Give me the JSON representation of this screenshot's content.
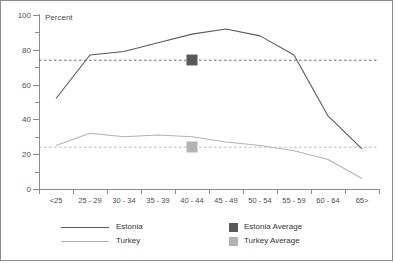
{
  "chart_data": {
    "type": "line",
    "title": "",
    "xlabel": "",
    "ylabel": "Percent",
    "ylim": [
      0,
      100
    ],
    "ytick_labels": [
      "0",
      "20",
      "40",
      "60",
      "80",
      "100"
    ],
    "ytick_values": [
      0,
      20,
      40,
      60,
      80,
      100
    ],
    "yminor_values": [
      10,
      30,
      50,
      70,
      90
    ],
    "grid": false,
    "legend_position": "bottom",
    "categories": [
      "<25",
      "25 - 29",
      "30 - 34",
      "35 - 39",
      "40 - 44",
      "45 - 49",
      "50 - 54",
      "55 - 59",
      "60 - 64",
      "65>"
    ],
    "series": [
      {
        "name": "Estonia",
        "color": "#595959",
        "values": [
          52,
          77,
          79,
          84,
          89,
          92,
          88,
          77,
          42,
          23
        ]
      },
      {
        "name": "Turkey",
        "color": "#b3b3b3",
        "values": [
          25,
          32,
          30,
          31,
          30,
          27,
          25,
          22,
          17,
          6
        ]
      }
    ],
    "reference_lines": [
      {
        "name": "Estonia Average",
        "value": 74,
        "color": "#595959",
        "style": "dashed",
        "marker": "square",
        "marker_category": "40 - 44"
      },
      {
        "name": "Turkey Average",
        "value": 24,
        "color": "#b3b3b3",
        "style": "dashed",
        "marker": "square",
        "marker_category": "40 - 44"
      }
    ],
    "legend": [
      {
        "label": "Estonia",
        "glyph": "line",
        "color": "#595959"
      },
      {
        "label": "Turkey",
        "glyph": "line",
        "color": "#b3b3b3"
      },
      {
        "label": "Estonia Average",
        "glyph": "square",
        "color": "#595959"
      },
      {
        "label": "Turkey Average",
        "glyph": "square",
        "color": "#b3b3b3"
      }
    ]
  }
}
